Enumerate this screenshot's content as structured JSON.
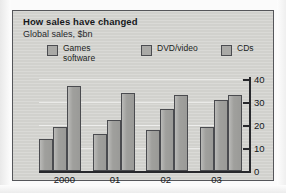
{
  "figure": {
    "title": "How sales have changed",
    "subtitle": "Global sales, $bn"
  },
  "legend": {
    "items": [
      {
        "label": "Games\nsoftware",
        "swatch_name": "games-software-swatch"
      },
      {
        "label": "DVD/video",
        "swatch_name": "dvd-video-swatch"
      },
      {
        "label": "CDs",
        "swatch_name": "cds-swatch"
      }
    ]
  },
  "axis": {
    "y_ticks": [
      "0",
      "10",
      "20",
      "30",
      "40"
    ],
    "x_ticks": [
      "2000",
      "01",
      "02",
      "03"
    ]
  },
  "colors": {
    "panel_background": "#d6d6d2",
    "panel_border": "#55565a",
    "bar_fill": "#a6a6a3",
    "bar_border": "#4a4b4f",
    "axis": "#27282c",
    "text": "#16181c"
  },
  "chart_data": {
    "type": "bar",
    "title": "How sales have changed",
    "subtitle": "Global sales, $bn",
    "xlabel": "",
    "ylabel": "$bn",
    "categories": [
      "2000",
      "01",
      "02",
      "03"
    ],
    "series": [
      {
        "name": "Games software",
        "values": [
          14,
          16,
          18,
          19
        ]
      },
      {
        "name": "DVD/video",
        "values": [
          19,
          22,
          27,
          31
        ]
      },
      {
        "name": "CDs",
        "values": [
          37,
          34,
          33,
          33
        ]
      }
    ],
    "ylim": [
      0,
      40
    ],
    "yticks": [
      0,
      10,
      20,
      30,
      40
    ],
    "y_axis_position": "right",
    "grid": true,
    "legend_position": "top"
  }
}
